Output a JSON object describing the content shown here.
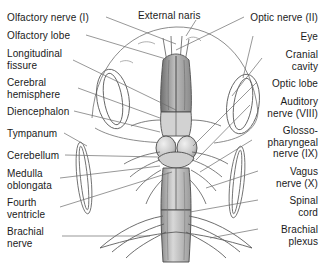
{
  "figure": {
    "style": {
      "background": "#ffffff",
      "text_color": "#1a1a1a",
      "leader_line_color": "#6b6b6b",
      "outline_color": "#4a4a4a",
      "shade_color": "#9a9a9a"
    }
  },
  "labels": {
    "top": [
      {
        "id": "external-naris",
        "text": "External naris",
        "x": 138,
        "y": 10,
        "align": "left"
      }
    ],
    "left": [
      {
        "id": "olfactory-nerve-i",
        "text": "Olfactory nerve (I)",
        "x": 7,
        "y": 12,
        "align": "left"
      },
      {
        "id": "olfactory-lobe",
        "text": "Olfactory lobe",
        "x": 7,
        "y": 30,
        "align": "left"
      },
      {
        "id": "longitudinal-fissure",
        "text": "Longitudinal\nfissure",
        "x": 7,
        "y": 48,
        "align": "left"
      },
      {
        "id": "cerebral-hemisphere",
        "text": "Cerebral\nhemisphere",
        "x": 7,
        "y": 77,
        "align": "left"
      },
      {
        "id": "diencephalon",
        "text": "Diencephalon",
        "x": 7,
        "y": 106,
        "align": "left"
      },
      {
        "id": "tympanum",
        "text": "Tympanum",
        "x": 7,
        "y": 128,
        "align": "left"
      },
      {
        "id": "cerebellum",
        "text": "Cerebellum",
        "x": 7,
        "y": 150,
        "align": "left"
      },
      {
        "id": "medulla-oblongata",
        "text": "Medulla\noblongata",
        "x": 7,
        "y": 168,
        "align": "left"
      },
      {
        "id": "fourth-ventricle",
        "text": "Fourth\nventricle",
        "x": 7,
        "y": 197,
        "align": "left"
      },
      {
        "id": "brachial-nerve",
        "text": "Brachial\nnerve",
        "x": 7,
        "y": 226,
        "align": "left"
      }
    ],
    "right": [
      {
        "id": "optic-nerve-ii",
        "text": "Optic nerve (II)",
        "x": 318,
        "y": 12,
        "align": "right"
      },
      {
        "id": "eye",
        "text": "Eye",
        "x": 318,
        "y": 31,
        "align": "right"
      },
      {
        "id": "cranial-cavity",
        "text": "Cranial\ncavity",
        "x": 318,
        "y": 49,
        "align": "right"
      },
      {
        "id": "optic-lobe",
        "text": "Optic lobe",
        "x": 318,
        "y": 78,
        "align": "right"
      },
      {
        "id": "auditory-nerve-viii",
        "text": "Auditory\nnerve (VIII)",
        "x": 318,
        "y": 96,
        "align": "right"
      },
      {
        "id": "glossopharyngeal-nerve-ix",
        "text": "Glosso-\npharyngeal\nnerve (IX)",
        "x": 318,
        "y": 125,
        "align": "right"
      },
      {
        "id": "vagus-nerve-x",
        "text": "Vagus\nnerve (X)",
        "x": 318,
        "y": 166,
        "align": "right"
      },
      {
        "id": "spinal-cord",
        "text": "Spinal\ncord",
        "x": 318,
        "y": 195,
        "align": "right"
      },
      {
        "id": "brachial-plexus",
        "text": "Brachial\nplexus",
        "x": 318,
        "y": 224,
        "align": "right"
      }
    ]
  }
}
